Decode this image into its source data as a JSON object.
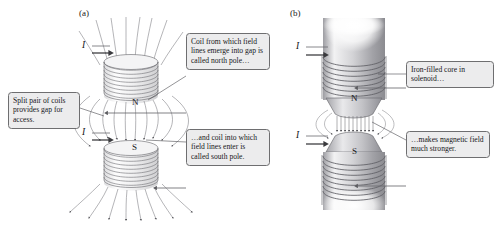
{
  "figure": {
    "background": "#ffffff",
    "line_color": "#6a6a6e",
    "text_color": "#17171a",
    "callout_fill": "#ececed",
    "callout_border": "#6e6e70"
  },
  "panels": [
    {
      "id": "a",
      "label": "(a)",
      "description": "air-core split pair of coils"
    },
    {
      "id": "b",
      "label": "(b)",
      "description": "iron-filled core solenoids"
    }
  ],
  "callouts": [
    {
      "id": "coil-north",
      "text": "Coil from which field lines emerge into gap is called north pole…"
    },
    {
      "id": "split-pair",
      "text": "Split pair of coils provides gap for access."
    },
    {
      "id": "coil-south",
      "text": "…and coil into which field lines enter is called south pole."
    },
    {
      "id": "iron-core",
      "text": "Iron-filled core in solenoid…"
    },
    {
      "id": "stronger",
      "text": "…makes magnetic field much stronger."
    }
  ],
  "current_labels": [
    {
      "id": "a-top",
      "symbol": "I"
    },
    {
      "id": "a-bottom",
      "symbol": "I"
    },
    {
      "id": "b-top",
      "symbol": "I"
    },
    {
      "id": "b-bottom",
      "symbol": "I"
    }
  ],
  "pole_labels": [
    {
      "id": "a-north",
      "symbol": "N"
    },
    {
      "id": "a-south",
      "symbol": "S"
    },
    {
      "id": "b-north",
      "symbol": "N"
    },
    {
      "id": "b-south",
      "symbol": "S"
    }
  ]
}
